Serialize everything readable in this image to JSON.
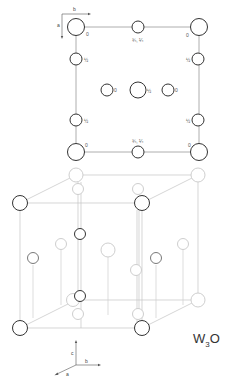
{
  "figure": {
    "compound": "W3O",
    "formula_base": "W",
    "formula_subscript": "3",
    "formula_tail": "O"
  },
  "plan_view": {
    "axes": {
      "horizontal": "b",
      "vertical": "a"
    },
    "atoms": [
      {
        "id": "corner-tl",
        "x": 76,
        "y": 27,
        "r": 8.5,
        "height_label": "0"
      },
      {
        "id": "corner-tr",
        "x": 199,
        "y": 27,
        "r": 8.5,
        "height_label": "0"
      },
      {
        "id": "corner-bl",
        "x": 76,
        "y": 152,
        "r": 8.5,
        "height_label": "0"
      },
      {
        "id": "corner-br",
        "x": 199,
        "y": 152,
        "r": 8.5,
        "height_label": "0"
      },
      {
        "id": "edge-top-mid",
        "x": 138,
        "y": 27,
        "r": 6,
        "height_label": "¾, ¼"
      },
      {
        "id": "edge-bottom-mid",
        "x": 138,
        "y": 152,
        "r": 6,
        "height_label": "¾, ¼"
      },
      {
        "id": "left-upper",
        "x": 76,
        "y": 59,
        "r": 6,
        "height_label": "½"
      },
      {
        "id": "left-lower",
        "x": 76,
        "y": 120,
        "r": 6,
        "height_label": "½"
      },
      {
        "id": "right-upper",
        "x": 198,
        "y": 59,
        "r": 6,
        "height_label": "½"
      },
      {
        "id": "right-lower",
        "x": 198,
        "y": 120,
        "r": 6,
        "height_label": "½"
      },
      {
        "id": "center-left",
        "x": 107,
        "y": 90,
        "r": 6,
        "height_label": "0"
      },
      {
        "id": "center",
        "x": 138,
        "y": 90,
        "r": 8,
        "height_label": "½"
      },
      {
        "id": "center-right",
        "x": 168,
        "y": 90,
        "r": 6,
        "height_label": "0"
      }
    ]
  },
  "perspective_view": {
    "axes": {
      "vertical": "c",
      "right": "b",
      "front": "a"
    }
  }
}
